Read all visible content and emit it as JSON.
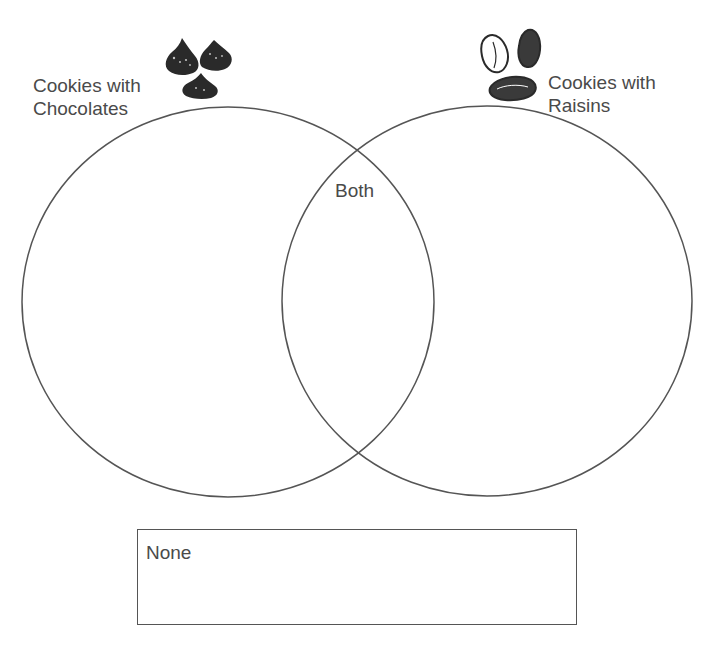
{
  "diagram": {
    "type": "venn",
    "sets": [
      {
        "id": "chocolates",
        "label_line1": "Cookies with",
        "label_line2": "Chocolates",
        "icon": "chocolate-chip-icon"
      },
      {
        "id": "raisins",
        "label_line1": "Cookies with",
        "label_line2": "Raisins",
        "icon": "raisin-icon"
      }
    ],
    "intersection_label": "Both",
    "outside_box_label": "None",
    "colors": {
      "stroke": "#555555",
      "text": "#4a4a4a",
      "icon_fill": "#2a2a2a",
      "background": "#ffffff"
    }
  }
}
